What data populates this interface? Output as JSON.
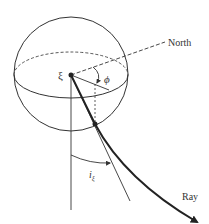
{
  "diagram": {
    "type": "geometry",
    "labels": {
      "source": "ξ",
      "azimuth": "ϕ",
      "north": "North",
      "takeoff": "i",
      "takeoff_subscript": "ξ",
      "ray": "Ray"
    },
    "colors": {
      "stroke": "#333333",
      "background": "#ffffff"
    }
  }
}
